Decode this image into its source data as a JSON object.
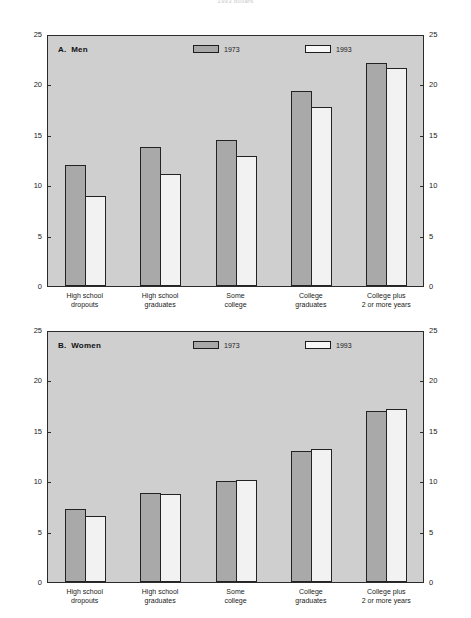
{
  "figure": {
    "title": "1993 dollars"
  },
  "axis": {
    "ticks": [
      0,
      5,
      10,
      15,
      20,
      25
    ],
    "ymin": 0,
    "ymax": 25
  },
  "legend": {
    "series": [
      {
        "label": "1973",
        "color": "#a9a9a9"
      },
      {
        "label": "1993",
        "color": "#f2f2f2"
      }
    ]
  },
  "panels": [
    {
      "id": "men",
      "label": "A.  Men"
    },
    {
      "id": "women",
      "label": "B.  Women"
    }
  ],
  "categories": [
    {
      "line1": "High school",
      "line2": "dropouts"
    },
    {
      "line1": "High school",
      "line2": "graduates"
    },
    {
      "line1": "Some",
      "line2": "college"
    },
    {
      "line1": "College",
      "line2": "graduates"
    },
    {
      "line1": "College plus",
      "line2": "2 or more years"
    }
  ],
  "chart_data": [
    {
      "type": "bar",
      "title": "A.  Men",
      "xlabel": "",
      "ylabel": "",
      "ylim": [
        0,
        25
      ],
      "yticks": [
        0,
        5,
        10,
        15,
        20,
        25
      ],
      "grid": false,
      "legend_position": "top-center",
      "categories": [
        "High school dropouts",
        "High school graduates",
        "Some college",
        "College graduates",
        "College plus 2 or more years"
      ],
      "series": [
        {
          "name": "1973",
          "values": [
            12.0,
            13.8,
            14.5,
            19.3,
            22.1
          ]
        },
        {
          "name": "1993",
          "values": [
            8.9,
            11.1,
            12.9,
            17.8,
            21.6
          ]
        }
      ]
    },
    {
      "type": "bar",
      "title": "B.  Women",
      "xlabel": "",
      "ylabel": "",
      "ylim": [
        0,
        25
      ],
      "yticks": [
        0,
        5,
        10,
        15,
        20,
        25
      ],
      "grid": false,
      "legend_position": "top-center",
      "categories": [
        "High school dropouts",
        "High school graduates",
        "Some college",
        "College graduates",
        "College plus 2 or more years"
      ],
      "series": [
        {
          "name": "1973",
          "values": [
            7.2,
            8.8,
            10.0,
            13.0,
            17.0
          ]
        },
        {
          "name": "1993",
          "values": [
            6.5,
            8.7,
            10.1,
            13.2,
            17.2
          ]
        }
      ]
    }
  ]
}
